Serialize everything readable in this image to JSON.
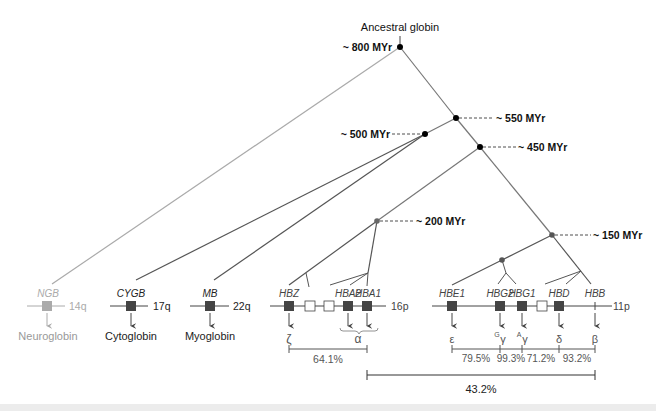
{
  "title": "Ancestral globin",
  "colors": {
    "line": "#777777",
    "dark_line": "#555555",
    "light": "#aaaaaa",
    "node": "#000000",
    "node_gray": "#666666",
    "gene_box": "#444444",
    "gene_box_light": "#aaaaaa",
    "pseudo_box": "#ffffff",
    "text": "#222222",
    "text_light": "#999999"
  },
  "nodes": [
    {
      "id": "n800",
      "label": "~ 800 MYr",
      "age_myr": 800
    },
    {
      "id": "n550",
      "label": "~ 550 MYr",
      "age_myr": 550
    },
    {
      "id": "n500",
      "label": "~ 500 MYr",
      "age_myr": 500
    },
    {
      "id": "n450",
      "label": "~ 450 MYr",
      "age_myr": 450
    },
    {
      "id": "n200",
      "label": "~ 200 MYr",
      "age_myr": 200
    },
    {
      "id": "n150",
      "label": "~ 150 MYr",
      "age_myr": 150
    }
  ],
  "loci": [
    {
      "id": "ngb",
      "gene": "NGB",
      "chromosome": "14q",
      "product": "Neuroglobin",
      "faded": true
    },
    {
      "id": "cygb",
      "gene": "CYGB",
      "chromosome": "17q",
      "product": "Cytoglobin",
      "faded": false
    },
    {
      "id": "mb",
      "gene": "MB",
      "chromosome": "22q",
      "product": "Myoglobin",
      "faded": false
    }
  ],
  "alpha_cluster": {
    "chromosome": "16p",
    "genes": [
      "HBZ",
      "HBA2",
      "HBA1"
    ],
    "products": {
      "zeta": "ζ",
      "alpha": "α"
    },
    "identity": [
      "64.1%"
    ]
  },
  "beta_cluster": {
    "chromosome": "11p",
    "genes": [
      "HBE1",
      "HBG2",
      "HBG1",
      "HBD",
      "HBB"
    ],
    "products": [
      {
        "sym": "ε",
        "sup": ""
      },
      {
        "sym": "γ",
        "sup": "G"
      },
      {
        "sym": "γ",
        "sup": "A"
      },
      {
        "sym": "δ",
        "sup": ""
      },
      {
        "sym": "β",
        "sup": ""
      }
    ],
    "identity": [
      "79.5%",
      "99.3%",
      "71.2%",
      "93.2%"
    ]
  },
  "alpha_beta_identity": "43.2%"
}
